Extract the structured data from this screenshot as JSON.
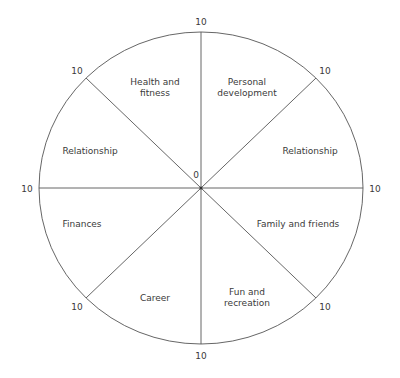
{
  "diagram": {
    "type": "wheel-of-life",
    "center_label": "0",
    "max_value_label": "10",
    "segments": [
      {
        "id": "health",
        "label": "Health and\nfitness",
        "lines": [
          "Health and",
          "fitness"
        ]
      },
      {
        "id": "personal",
        "label": "Personal development",
        "lines": [
          "Personal",
          "development"
        ]
      },
      {
        "id": "relationship-right",
        "label": "Relationship",
        "lines": [
          "Relationship"
        ]
      },
      {
        "id": "family",
        "label": "Family and friends",
        "lines": [
          "Family and friends"
        ]
      },
      {
        "id": "fun",
        "label": "Fun and recreation",
        "lines": [
          "Fun and",
          "recreation"
        ]
      },
      {
        "id": "career",
        "label": "Career",
        "lines": [
          "Career"
        ]
      },
      {
        "id": "finances",
        "label": "Finances",
        "lines": [
          "Finances"
        ]
      },
      {
        "id": "relationship-left",
        "label": "Relationship",
        "lines": [
          "Relationship"
        ]
      }
    ],
    "spoke_end_labels": [
      "10",
      "10",
      "10",
      "10",
      "10",
      "10",
      "10",
      "10"
    ]
  }
}
